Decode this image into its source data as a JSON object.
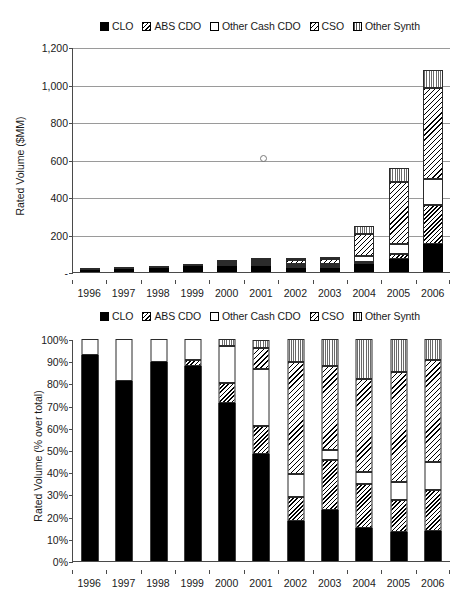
{
  "legend": {
    "items": [
      {
        "label": "CLO",
        "key": "clo",
        "swatch": "solid-black-square-icon",
        "color": "#000000"
      },
      {
        "label": "ABS CDO",
        "key": "abs",
        "swatch": "diagonal-dense-hatch-square-icon",
        "color": "#000000"
      },
      {
        "label": "Other Cash CDO",
        "key": "cash",
        "swatch": "empty-white-square-icon",
        "color": "#ffffff"
      },
      {
        "label": "CSO",
        "key": "cso",
        "swatch": "diagonal-sparse-hatch-square-icon",
        "color": "#000000"
      },
      {
        "label": "Other Synth",
        "key": "synth",
        "swatch": "vertical-line-hatch-square-icon",
        "color": "#666666"
      }
    ]
  },
  "chart_data": [
    {
      "id": "volume-chart",
      "type": "bar",
      "stacked": true,
      "title": "",
      "xlabel": "",
      "ylabel": "Rated Volume ($MM)",
      "categories": [
        "1996",
        "1997",
        "1998",
        "1999",
        "2000",
        "2001",
        "2002",
        "2003",
        "2004",
        "2005",
        "2006"
      ],
      "ylim": [
        0,
        1200
      ],
      "yticks": [
        0,
        200,
        400,
        600,
        800,
        1000,
        1200
      ],
      "ytick_labels": [
        "-",
        "200",
        "400",
        "600",
        "800",
        "1,000",
        "1,200"
      ],
      "grid": true,
      "legend_position": "top",
      "series": [
        {
          "name": "CLO",
          "key": "clo",
          "values": [
            7,
            15,
            22,
            32,
            30,
            30,
            22,
            22,
            44,
            72,
            147
          ]
        },
        {
          "name": "ABS CDO",
          "key": "abs",
          "values": [
            0,
            0,
            0,
            0,
            4,
            5,
            5,
            6,
            12,
            24,
            212
          ]
        },
        {
          "name": "Other Cash CDO",
          "key": "cash",
          "values": [
            1,
            3,
            2,
            3,
            4,
            8,
            10,
            9,
            28,
            55,
            135
          ]
        },
        {
          "name": "CSO",
          "key": "cso",
          "values": [
            0,
            0,
            0,
            0,
            0,
            10,
            22,
            28,
            118,
            330,
            485
          ]
        },
        {
          "name": "Other Synth",
          "key": "synth",
          "values": [
            0,
            0,
            0,
            0,
            2,
            4,
            7,
            9,
            45,
            74,
            101
          ]
        }
      ],
      "totals": [
        8,
        18,
        24,
        35,
        40,
        57,
        66,
        74,
        247,
        555,
        1080
      ],
      "annotations": [
        {
          "name": "stray-circle-marker",
          "x_category": "2001",
          "y_value": 615
        }
      ]
    },
    {
      "id": "share-chart",
      "type": "bar",
      "stacked": true,
      "normalized": true,
      "title": "",
      "xlabel": "",
      "ylabel": "Rated Volume (% over total)",
      "categories": [
        "1996",
        "1997",
        "1998",
        "1999",
        "2000",
        "2001",
        "2002",
        "2003",
        "2004",
        "2005",
        "2006"
      ],
      "ylim": [
        0,
        100
      ],
      "yticks": [
        0,
        10,
        20,
        30,
        40,
        50,
        60,
        70,
        80,
        90,
        100
      ],
      "ytick_labels": [
        "0%",
        "10%",
        "20%",
        "30%",
        "40%",
        "50%",
        "60%",
        "70%",
        "80%",
        "90%",
        "100%"
      ],
      "grid": false,
      "legend_position": "top",
      "series": [
        {
          "name": "CLO",
          "key": "clo",
          "values": [
            93,
            81,
            89.5,
            88,
            71,
            48,
            18,
            23,
            15,
            13,
            13.5
          ]
        },
        {
          "name": "ABS CDO",
          "key": "abs",
          "values": [
            0,
            0,
            0,
            2.5,
            9,
            13,
            11,
            22.5,
            19.5,
            14.5,
            18.5
          ]
        },
        {
          "name": "Other Cash CDO",
          "key": "cash",
          "values": [
            7,
            19,
            10.5,
            9.5,
            17,
            25.5,
            10,
            4.5,
            5.5,
            8,
            12.5
          ]
        },
        {
          "name": "CSO",
          "key": "cso",
          "values": [
            0,
            0,
            0,
            0,
            0,
            9.5,
            50.5,
            38,
            42,
            49.5,
            46
          ]
        },
        {
          "name": "Other Synth",
          "key": "synth",
          "values": [
            0,
            0,
            0,
            0,
            3,
            3.5,
            10.5,
            12,
            18,
            15,
            9.5
          ]
        }
      ]
    }
  ]
}
